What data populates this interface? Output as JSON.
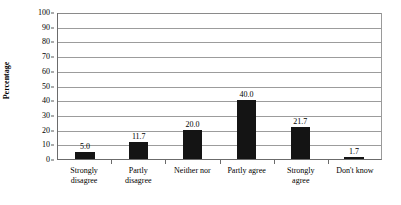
{
  "chart_data": {
    "type": "bar",
    "title": "",
    "xlabel": "",
    "ylabel": "Percentage",
    "ylim": [
      0,
      100
    ],
    "ytick_step": 10,
    "yticks": [
      0,
      10,
      20,
      30,
      40,
      50,
      60,
      70,
      80,
      90,
      100
    ],
    "ytick_labels": [
      "0",
      "10",
      "20",
      "30",
      "40",
      "50",
      "60",
      "70",
      "80",
      "90",
      "100"
    ],
    "grid": true,
    "grid_axis": "y",
    "legend": false,
    "legend_position": "none",
    "bar_color": "#141414",
    "grid_color": "#9c9c9c",
    "axis_color": "#6b6b6b",
    "background_color": "#ffffff",
    "categories": [
      "Strongly disagree",
      "Partly disagree",
      "Neither nor",
      "Partly agree",
      "Strongly agree",
      "Don't know"
    ],
    "category_label_lines": [
      [
        "Strongly",
        "disagree"
      ],
      [
        "Partly",
        "disagree"
      ],
      [
        "Neither nor"
      ],
      [
        "Partly agree"
      ],
      [
        "Strongly",
        "agree"
      ],
      [
        "Don't know"
      ]
    ],
    "values": [
      5.0,
      11.7,
      20.0,
      40.0,
      21.7,
      1.7
    ],
    "value_labels": [
      "5.0",
      "11.7",
      "20.0",
      "40.0",
      "21.7",
      "1.7"
    ]
  }
}
